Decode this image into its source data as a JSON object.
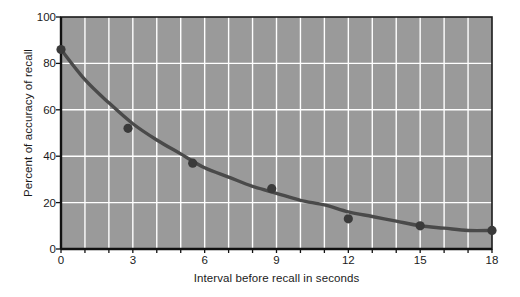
{
  "chart_data": {
    "type": "scatter",
    "title": "",
    "subtitle": "",
    "xlabel": "Interval before recall in seconds",
    "ylabel": "Percent of accuracy of recall",
    "xlim": [
      0,
      18
    ],
    "ylim": [
      0,
      100
    ],
    "xticks": [
      "0",
      "3",
      "6",
      "9",
      "12",
      "15",
      "18"
    ],
    "xtick_values": [
      0,
      3,
      6,
      9,
      12,
      15,
      18
    ],
    "yticks": [
      "0",
      "20",
      "40",
      "60",
      "80",
      "100"
    ],
    "ytick_values": [
      0,
      20,
      40,
      60,
      80,
      100
    ],
    "x_minor_step": 1,
    "y_minor_step": 20,
    "grid": true,
    "grid_color": "#ffffff",
    "plot_background": "#9a9a9a",
    "figure_background": "#ffffff",
    "legend": null,
    "legend_position": "none",
    "series": [
      {
        "name": "Percent of accuracy of recall",
        "marker_color": "#3a3a3a",
        "line_color": "#4a4a4a",
        "x": [
          0,
          2.8,
          5.5,
          8.8,
          12,
          15,
          18
        ],
        "values": [
          86,
          52,
          37,
          26,
          13,
          10,
          8
        ]
      }
    ],
    "fit_curve": {
      "description": "smooth decaying curve through the data points",
      "x": [
        0,
        1,
        2,
        3,
        4,
        5,
        6,
        7,
        8,
        9,
        10,
        11,
        12,
        13,
        14,
        15,
        16,
        17,
        18
      ],
      "values": [
        86,
        73,
        63,
        54,
        47,
        41,
        35,
        31,
        27,
        24,
        21,
        19,
        16,
        14,
        12,
        10,
        9,
        8,
        8
      ]
    }
  }
}
